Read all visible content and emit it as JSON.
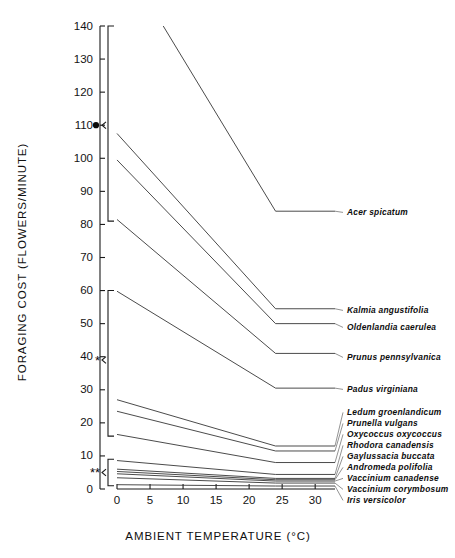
{
  "figure": {
    "title": "",
    "axis": {
      "y_label": "FORAGING COST (FLOWERS/MINUTE)",
      "x_label": "AMBIENT TEMPERATURE (°C)",
      "y_ticks": [
        "0",
        "10",
        "20",
        "30",
        "40",
        "50",
        "60",
        "70",
        "80",
        "90",
        "100",
        "110",
        "120",
        "130",
        "140"
      ],
      "x_ticks": [
        "0",
        "5",
        "10",
        "15",
        "20",
        "25",
        "30"
      ]
    },
    "significance": {
      "group_high_marker": "●",
      "group_mid_marker": "*",
      "group_low_marker": "**"
    }
  },
  "chart_data": {
    "type": "line",
    "title": "",
    "xlabel": "AMBIENT TEMPERATURE (°C)",
    "ylabel": "FORAGING COST (FLOWERS/MINUTE)",
    "xlim": [
      0,
      33
    ],
    "ylim": [
      0,
      140
    ],
    "xticks": [
      0,
      5,
      10,
      15,
      20,
      25,
      30
    ],
    "yticks": [
      0,
      10,
      20,
      30,
      40,
      50,
      60,
      70,
      80,
      90,
      100,
      110,
      120,
      130,
      140
    ],
    "grid": false,
    "legend": "right-inline-labels",
    "note": "Each species is a two-segment line: steep decline from low temperature to a breakpoint near 24 degrees C, then a flat plateau out to 33 degrees C.",
    "series": [
      {
        "name": "Acer spicatum",
        "x": [
          7,
          24,
          33
        ],
        "y": [
          140.0,
          84.0,
          84.0
        ]
      },
      {
        "name": "Kalmia angustifolia",
        "x": [
          0,
          24,
          33
        ],
        "y": [
          107.5,
          54.5,
          54.5
        ]
      },
      {
        "name": "Oldenlandia caerulea",
        "x": [
          0,
          24,
          33
        ],
        "y": [
          99.5,
          50.0,
          50.0
        ]
      },
      {
        "name": "Prunus pennsylvanica",
        "x": [
          0,
          24,
          33
        ],
        "y": [
          81.5,
          41.0,
          41.0
        ]
      },
      {
        "name": "Padus virginiana",
        "x": [
          0,
          24,
          33
        ],
        "y": [
          59.8,
          30.5,
          30.5
        ]
      },
      {
        "name": "Ledum groenlandicum",
        "x": [
          0,
          24,
          33
        ],
        "y": [
          27.0,
          13.0,
          13.0
        ]
      },
      {
        "name": "Prunella vulgans",
        "x": [
          0,
          24,
          33
        ],
        "y": [
          23.5,
          11.5,
          11.5
        ]
      },
      {
        "name": "Oxycoccus oxycoccus",
        "x": [
          0,
          24,
          33
        ],
        "y": [
          16.5,
          8.0,
          8.0
        ]
      },
      {
        "name": "Rhodora canadensis",
        "x": [
          0,
          24,
          33
        ],
        "y": [
          8.6,
          4.4,
          4.4
        ]
      },
      {
        "name": "Gaylussacia buccata",
        "x": [
          0,
          24,
          33
        ],
        "y": [
          6.0,
          3.2,
          3.2
        ]
      },
      {
        "name": "Andromeda polifolia",
        "x": [
          0,
          24,
          33
        ],
        "y": [
          5.3,
          2.8,
          2.8
        ]
      },
      {
        "name": "Vaccinium canadense",
        "x": [
          0,
          24,
          33
        ],
        "y": [
          4.6,
          2.4,
          2.4
        ]
      },
      {
        "name": "Vaccinium corymbosum",
        "x": [
          0,
          24,
          33
        ],
        "y": [
          3.4,
          1.8,
          1.8
        ]
      },
      {
        "name": "Iris versicolor",
        "x": [
          0,
          24,
          33
        ],
        "y": [
          1.3,
          0.9,
          0.9
        ]
      }
    ],
    "labels_right": [
      {
        "text": "Acer spicatum",
        "label_y": 215
      },
      {
        "text": "Kalmia angustifolia",
        "label_y": 313
      },
      {
        "text": "Oldenlandia caerulea",
        "label_y": 330
      },
      {
        "text": "Prunus pennsylvanica",
        "label_y": 360
      },
      {
        "text": "Padus virginiana",
        "label_y": 392
      },
      {
        "text": "Ledum groenlandicum",
        "label_y": 415
      },
      {
        "text": "Prunella vulgans",
        "label_y": 426
      },
      {
        "text": "Oxycoccus oxycoccus",
        "label_y": 437
      },
      {
        "text": "Rhodora canadensis",
        "label_y": 448
      },
      {
        "text": "Gaylussacia buccata",
        "label_y": 459
      },
      {
        "text": "Andromeda polifolia",
        "label_y": 470
      },
      {
        "text": "Vaccinium canadense",
        "label_y": 481
      },
      {
        "text": "Vaccinium corymbosum",
        "label_y": 492
      },
      {
        "text": "Iris versicolor",
        "label_y": 503
      }
    ],
    "brackets": [
      {
        "marker": "●",
        "y_top": 140,
        "y_bottom": 81,
        "marker_y": 110
      },
      {
        "marker": "*",
        "y_top": 60,
        "y_bottom": 16,
        "marker_y": 39
      },
      {
        "marker": "**",
        "y_top": 9,
        "y_bottom": 1,
        "marker_y": 5
      }
    ]
  }
}
